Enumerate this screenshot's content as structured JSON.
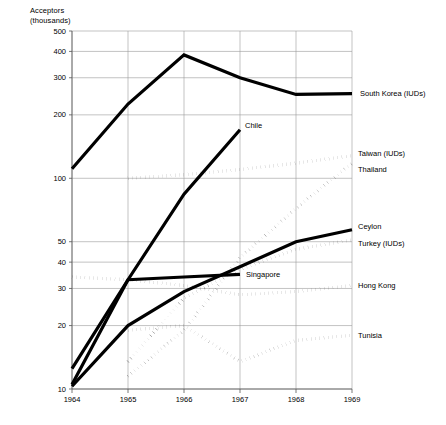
{
  "chart_data": {
    "type": "line",
    "title": "",
    "ylabel": "Acceptors\n(thousands)",
    "xlabel": "",
    "yscale": "log",
    "ylim": [
      10,
      500
    ],
    "xlim": [
      1964,
      1969
    ],
    "grid": true,
    "legend_position": "right-inline-labels",
    "yticks": [
      10,
      20,
      30,
      40,
      50,
      100,
      200,
      300,
      400,
      500
    ],
    "ytick_labels": [
      "10",
      "20",
      "30",
      "40",
      "50",
      "100",
      "200",
      "300",
      "400",
      "500"
    ],
    "xticks": [
      1964,
      1965,
      1966,
      1967,
      1968,
      1969
    ],
    "xtick_labels": [
      "1964",
      "1965",
      "1966",
      "1967",
      "1968",
      "1969"
    ],
    "x": [
      1964,
      1965,
      1966,
      1967,
      1968,
      1969
    ],
    "series": [
      {
        "name": "South Korea (IUDs)",
        "style": "solid",
        "label": "South Korea (IUDs)",
        "x": [
          1964,
          1965,
          1966,
          1967,
          1968,
          1969
        ],
        "values": [
          111,
          225,
          385,
          300,
          250,
          252
        ]
      },
      {
        "name": "Chile",
        "style": "solid",
        "label": "Chile",
        "x": [
          1964,
          1965,
          1966,
          1967
        ],
        "values": [
          10.5,
          33,
          84,
          170
        ]
      },
      {
        "name": "Taiwan (IUDs)",
        "style": "dotted",
        "label": "Taiwan (IUDs)",
        "x": [
          1965,
          1966,
          1967,
          1968,
          1969
        ],
        "values": [
          100,
          104,
          110,
          118,
          128
        ]
      },
      {
        "name": "Thailand",
        "style": "dotted",
        "label": "Thailand",
        "x": [
          1965,
          1966,
          1967,
          1968,
          1969
        ],
        "values": [
          11.5,
          19,
          42,
          72,
          118
        ]
      },
      {
        "name": "Ceylon",
        "style": "solid",
        "label": "Ceylon",
        "x": [
          1964,
          1965,
          1966,
          1967,
          1968,
          1969
        ],
        "values": [
          10.3,
          20,
          29,
          38,
          50,
          57
        ]
      },
      {
        "name": "Turkey (IUDs)",
        "style": "dotted",
        "label": "Turkey (IUDs)",
        "x": [
          1965,
          1966,
          1967,
          1968,
          1969
        ],
        "values": [
          13.5,
          27,
          37,
          46,
          51
        ]
      },
      {
        "name": "Singapore",
        "style": "solid",
        "label": "Singapore",
        "x": [
          1964,
          1965,
          1966,
          1967
        ],
        "values": [
          12.5,
          33,
          34,
          35
        ]
      },
      {
        "name": "Hong Kong",
        "style": "dotted",
        "label": "Hong Kong",
        "x": [
          1964,
          1965,
          1966,
          1967,
          1968,
          1969
        ],
        "values": [
          34,
          33,
          31,
          28,
          29,
          31
        ]
      },
      {
        "name": "Tunisia",
        "style": "dotted",
        "label": "Tunisia",
        "x": [
          1965,
          1966,
          1967,
          1968,
          1969
        ],
        "values": [
          19,
          20,
          13.5,
          17,
          18
        ]
      }
    ]
  }
}
